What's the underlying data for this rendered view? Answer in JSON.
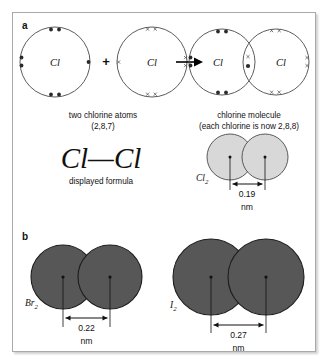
{
  "figure": {
    "panels": [
      {
        "id": "a",
        "label": "a",
        "reaction": {
          "reactants": [
            {
              "symbol": "Cl",
              "electron_style": "dot",
              "valence_electrons": 7
            },
            {
              "symbol": "Cl",
              "electron_style": "cross",
              "valence_electrons": 7
            }
          ],
          "plus_sign": "+",
          "arrow": "reaction-arrow",
          "products": [
            {
              "symbol": "Cl",
              "electron_style": "dot"
            },
            {
              "symbol": "Cl",
              "electron_style": "cross"
            }
          ],
          "shared_pair": {
            "cross": "x",
            "dot": "dot"
          }
        },
        "captions": {
          "reactant_line1": "two chlorine atoms",
          "reactant_line2": "(2,8,7)",
          "product_line1": "chlorine molecule",
          "product_line2": "(each chlorine is now 2,8,8)"
        },
        "displayed_formula": {
          "text": "Cl—Cl",
          "caption": "displayed formula"
        },
        "space_filling": {
          "label": "Cl",
          "label_subscript": "2",
          "bond_length_value": "0.19",
          "bond_length_unit": "nm",
          "fill_color": "#d8d8d8"
        }
      },
      {
        "id": "b",
        "label": "b",
        "molecules": [
          {
            "label": "Br",
            "label_subscript": "2",
            "bond_length_value": "0.22",
            "bond_length_unit": "nm",
            "fill_color": "#575757"
          },
          {
            "label": "I",
            "label_subscript": "2",
            "bond_length_value": "0.27",
            "bond_length_unit": "nm",
            "fill_color": "#575757"
          }
        ]
      }
    ],
    "colors": {
      "frame_border": "#a9a9a9",
      "background": "#ffffff",
      "shell_stroke": "#4a4a4a",
      "electron_dot": "#2b2b2b",
      "electron_cross": "#5a5a5a",
      "light_sphere": "#d8d8d8",
      "dark_sphere": "#575757",
      "text": "#111111"
    }
  }
}
